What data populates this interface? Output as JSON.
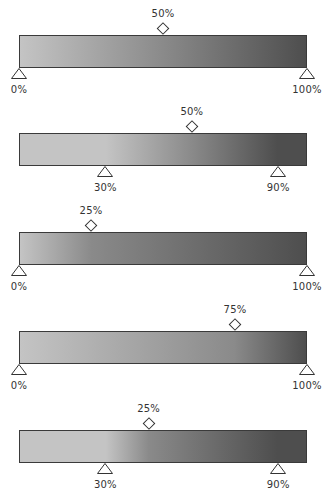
{
  "bar_geometry": {
    "left": 19,
    "width": 288
  },
  "gradients": [
    {
      "top": 35,
      "start_color": "#c4c4c4",
      "end_color": "#4e4e4e",
      "midpoint": 50,
      "midpoint_label": "50%",
      "stops": [
        {
          "position": 0,
          "label": "0%"
        },
        {
          "position": 100,
          "label": "100%"
        }
      ]
    },
    {
      "top": 133,
      "start_color": "#c4c4c4",
      "end_color": "#4e4e4e",
      "midpoint": 50,
      "midpoint_label": "50%",
      "stops": [
        {
          "position": 30,
          "label": "30%"
        },
        {
          "position": 90,
          "label": "90%"
        }
      ]
    },
    {
      "top": 232,
      "start_color": "#c4c4c4",
      "end_color": "#4e4e4e",
      "midpoint": 25,
      "midpoint_label": "25%",
      "stops": [
        {
          "position": 0,
          "label": "0%"
        },
        {
          "position": 100,
          "label": "100%"
        }
      ]
    },
    {
      "top": 331,
      "start_color": "#c4c4c4",
      "end_color": "#4e4e4e",
      "midpoint": 75,
      "midpoint_label": "75%",
      "stops": [
        {
          "position": 0,
          "label": "0%"
        },
        {
          "position": 100,
          "label": "100%"
        }
      ]
    },
    {
      "top": 430,
      "start_color": "#c4c4c4",
      "end_color": "#4e4e4e",
      "midpoint": 25,
      "midpoint_label": "25%",
      "stops": [
        {
          "position": 30,
          "label": "30%"
        },
        {
          "position": 90,
          "label": "90%"
        }
      ]
    }
  ]
}
